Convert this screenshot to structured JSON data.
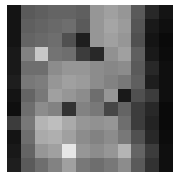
{
  "image": {
    "description": "Pixelated grayscale image (mosaic of gray blocks)",
    "rows": 12,
    "cols": 12,
    "gray_levels": [
      [
        20,
        90,
        95,
        100,
        100,
        95,
        150,
        160,
        150,
        90,
        40,
        20
      ],
      [
        20,
        95,
        100,
        105,
        110,
        90,
        150,
        165,
        155,
        85,
        25,
        15
      ],
      [
        20,
        100,
        105,
        110,
        80,
        30,
        150,
        160,
        150,
        80,
        20,
        10
      ],
      [
        25,
        130,
        200,
        115,
        110,
        60,
        40,
        145,
        160,
        95,
        25,
        12
      ],
      [
        25,
        110,
        110,
        140,
        150,
        150,
        140,
        135,
        140,
        90,
        40,
        15
      ],
      [
        30,
        120,
        125,
        150,
        160,
        155,
        140,
        130,
        120,
        95,
        30,
        15
      ],
      [
        20,
        100,
        120,
        160,
        150,
        140,
        110,
        150,
        25,
        80,
        60,
        15
      ],
      [
        15,
        110,
        140,
        130,
        50,
        130,
        120,
        70,
        100,
        60,
        40,
        10
      ],
      [
        60,
        120,
        180,
        190,
        170,
        150,
        145,
        150,
        110,
        60,
        35,
        10
      ],
      [
        20,
        110,
        170,
        175,
        160,
        140,
        130,
        140,
        120,
        80,
        40,
        12
      ],
      [
        25,
        100,
        150,
        160,
        230,
        150,
        140,
        150,
        180,
        100,
        60,
        15
      ],
      [
        30,
        90,
        110,
        130,
        160,
        120,
        110,
        120,
        140,
        90,
        50,
        15
      ]
    ]
  }
}
